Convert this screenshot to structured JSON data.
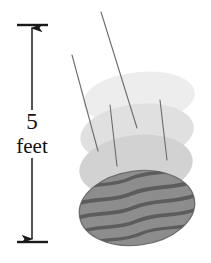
{
  "figure": {
    "kind": "diagram",
    "background_color": "#ffffff"
  },
  "dimension": {
    "value": "5",
    "unit": "feet",
    "full_label": "5 feet",
    "line_color": "#1a1a1a",
    "axis_x": 32,
    "top_y": 25,
    "bottom_y": 242,
    "tick_left_x": 17,
    "tick_right_x": 48,
    "arrow_style": "double-headed"
  },
  "watermelon": {
    "name": "watermelon",
    "fill_color": "#8d8d8d",
    "stripe_color": "#5c5c5c",
    "outline_color": "#6f6f6f",
    "center_x": 137,
    "center_y": 208,
    "radius_x": 58,
    "radius_y": 37,
    "rotation_deg": -8,
    "stripe_count": 5
  },
  "ghosts": [
    {
      "name": "ghost-top",
      "center_x": 139,
      "center_y": 98,
      "radius_x": 56,
      "radius_y": 26,
      "rotation_deg": -6,
      "fill_color": "#ededed"
    },
    {
      "name": "ghost-middle",
      "center_x": 137,
      "center_y": 133,
      "radius_x": 57,
      "radius_y": 29,
      "rotation_deg": -7,
      "fill_color": "#e0e0e0"
    },
    {
      "name": "ghost-bottom",
      "center_x": 136,
      "center_y": 166,
      "radius_x": 57,
      "radius_y": 31,
      "rotation_deg": -7,
      "fill_color": "#d2d2d2"
    }
  ],
  "motion_lines": [
    {
      "name": "motion-line-1",
      "x1": 101,
      "y1": 12,
      "x2": 137,
      "y2": 128,
      "color": "#6b6b6b"
    },
    {
      "name": "motion-line-2",
      "x1": 72,
      "y1": 55,
      "x2": 98,
      "y2": 151,
      "color": "#6b6b6b"
    },
    {
      "name": "motion-line-3",
      "x1": 110,
      "y1": 105,
      "x2": 117,
      "y2": 166,
      "color": "#6b6b6b"
    },
    {
      "name": "motion-line-4",
      "x1": 160,
      "y1": 100,
      "x2": 167,
      "y2": 160,
      "color": "#6b6b6b"
    }
  ]
}
